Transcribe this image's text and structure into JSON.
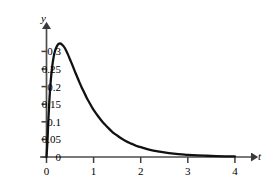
{
  "chart_data": {
    "type": "line",
    "title": "",
    "subtitle": "",
    "xlabel": "t",
    "ylabel": "y",
    "xlim": [
      0,
      4.25
    ],
    "ylim": [
      0,
      0.345
    ],
    "grid": false,
    "legend": null,
    "axis_style": "arrow-ended axes, ticks on axis lines only",
    "xticks": [
      0,
      1,
      2,
      3,
      4
    ],
    "xtick_labels": [
      "0",
      "1",
      "2",
      "3",
      "4"
    ],
    "yticks": [
      0,
      0.05,
      0.1,
      0.15,
      0.2,
      0.25,
      0.3
    ],
    "ytick_labels": [
      "0",
      "0.05",
      "0.1",
      "0.15",
      "0.2",
      "0.25",
      "0.3"
    ],
    "series": [
      {
        "name": "density curve",
        "color": "#111111",
        "line_width": 2.3,
        "peak": {
          "x": 0.3,
          "y": 0.322
        },
        "x": [
          0.0,
          0.02,
          0.04,
          0.06,
          0.08,
          0.1,
          0.12,
          0.15,
          0.18,
          0.21,
          0.24,
          0.27,
          0.3,
          0.33,
          0.36,
          0.4,
          0.45,
          0.5,
          0.55,
          0.6,
          0.65,
          0.7,
          0.75,
          0.8,
          0.85,
          0.9,
          0.95,
          1.0,
          1.1,
          1.2,
          1.3,
          1.4,
          1.5,
          1.6,
          1.7,
          1.8,
          1.9,
          2.0,
          2.2,
          2.4,
          2.6,
          2.8,
          3.0,
          3.2,
          3.4,
          3.6,
          3.8,
          4.0
        ],
        "y": [
          0.0,
          0.045,
          0.105,
          0.158,
          0.199,
          0.231,
          0.256,
          0.283,
          0.301,
          0.312,
          0.319,
          0.322,
          0.322,
          0.319,
          0.315,
          0.307,
          0.293,
          0.277,
          0.261,
          0.244,
          0.228,
          0.212,
          0.197,
          0.183,
          0.169,
          0.157,
          0.145,
          0.134,
          0.115,
          0.098,
          0.084,
          0.071,
          0.061,
          0.052,
          0.044,
          0.038,
          0.032,
          0.028,
          0.02,
          0.015,
          0.011,
          0.008,
          0.006,
          0.0045,
          0.0035,
          0.0027,
          0.002,
          0.0015
        ]
      }
    ]
  },
  "axes": {
    "y_axis_name": "y",
    "x_axis_name": "t"
  },
  "icons": {
    "y_arrow": "arrow-up-icon",
    "x_arrow": "arrow-right-icon"
  },
  "colors": {
    "curve": "#111111",
    "axis": "#4d4d4d",
    "text": "#000000",
    "background": "#ffffff"
  }
}
